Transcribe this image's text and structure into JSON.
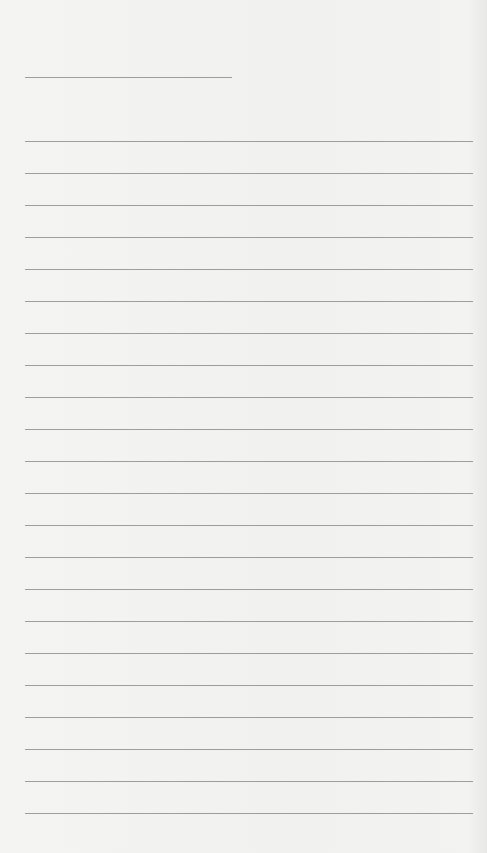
{
  "page": {
    "type": "lined-paper",
    "background_color": "#f3f3f2",
    "line_color": "#8e8e8e",
    "header_line": {
      "x": 25,
      "y": 77,
      "width": 207
    },
    "ruled_lines": {
      "count": 22,
      "start_y": 141,
      "spacing": 32,
      "x": 25,
      "width": 448
    }
  }
}
